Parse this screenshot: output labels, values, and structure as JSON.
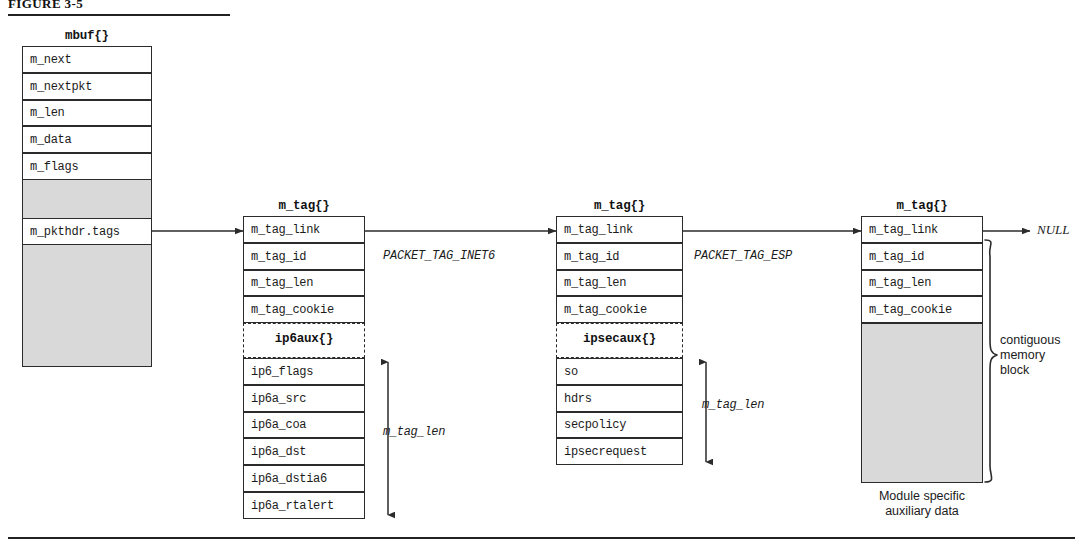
{
  "figure": {
    "label": "FIGURE 3-5",
    "top_rule": true,
    "bottom_rule": true
  },
  "mbuf": {
    "title": "mbuf{}",
    "fields": [
      "m_next",
      "m_nextpkt",
      "m_len",
      "m_data",
      "m_flags"
    ],
    "tags_field": "m_pkthdr.tags"
  },
  "tags": [
    {
      "title": "m_tag{}",
      "header_fields": [
        "m_tag_link",
        "m_tag_id",
        "m_tag_len",
        "m_tag_cookie"
      ],
      "aux_title": "ip6aux{}",
      "aux_fields": [
        "ip6_flags",
        "ip6a_src",
        "ip6a_coa",
        "ip6a_dst",
        "ip6a_dstia6",
        "ip6a_rtalert"
      ],
      "len_label": "m_tag_len",
      "out_edge_label": "PACKET_TAG_INET6"
    },
    {
      "title": "m_tag{}",
      "header_fields": [
        "m_tag_link",
        "m_tag_id",
        "m_tag_len",
        "m_tag_cookie"
      ],
      "aux_title": "ipsecaux{}",
      "aux_fields": [
        "so",
        "hdrs",
        "secpolicy",
        "ipsecrequest"
      ],
      "len_label": "m_tag_len",
      "out_edge_label": "PACKET_TAG_ESP"
    },
    {
      "title": "m_tag{}",
      "header_fields": [
        "m_tag_link",
        "m_tag_id",
        "m_tag_len",
        "m_tag_cookie"
      ],
      "aux_title": null,
      "aux_fields": [],
      "shaded_caption_line1": "Module specific",
      "shaded_caption_line2": "auxiliary data",
      "brace_label_line1": "contiguous",
      "brace_label_line2": "memory",
      "brace_label_line3": "block",
      "out_edge_label": "NULL"
    }
  ],
  "colors": {
    "line": "#2b2b2b",
    "shade": "#d9d9d9",
    "background": "#ffffff",
    "text": "#1b1b1b"
  }
}
